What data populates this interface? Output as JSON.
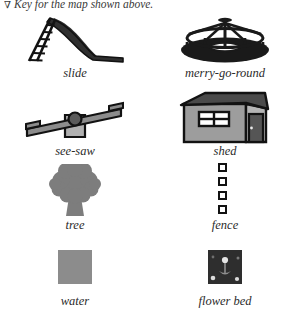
{
  "header": {
    "marker": "∇",
    "text": "Key for the map shown above."
  },
  "colors": {
    "ink": "#121212",
    "dark_fill": "#3a3a3a",
    "mid_gray": "#8c8c8c",
    "light_gray": "#b0b0b0",
    "tree_gray": "#7d7d7d",
    "roof": "#4a4a4a",
    "shed_body": "#9d9d9d",
    "door": "#555555",
    "flower_bed_bg": "#2e2e2e",
    "page_bg": "#ffffff",
    "text": "#2b2b2b"
  },
  "legend": {
    "rows": [
      {
        "cells": [
          {
            "icon": "slide-icon",
            "label": "slide"
          },
          {
            "icon": "merry-go-round-icon",
            "label": "merry-go-round"
          }
        ]
      },
      {
        "cells": [
          {
            "icon": "see-saw-icon",
            "label": "see-saw"
          },
          {
            "icon": "shed-icon",
            "label": "shed"
          }
        ]
      },
      {
        "cells": [
          {
            "icon": "tree-icon",
            "label": "tree"
          },
          {
            "icon": "fence-icon",
            "label": "fence"
          }
        ]
      },
      {
        "cells": [
          {
            "icon": "water-swatch-icon",
            "label": "water"
          },
          {
            "icon": "flower-bed-swatch-icon",
            "label": "flower bed"
          }
        ]
      }
    ]
  }
}
